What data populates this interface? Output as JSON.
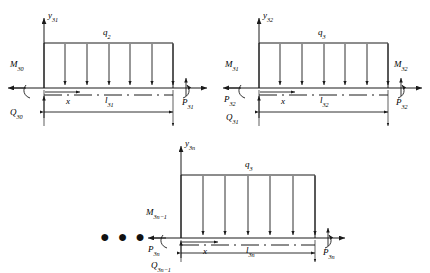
{
  "figure": {
    "type": "free-body-diagram-set",
    "ellipsis": "● ● ●",
    "stroke_color": "#1a1a1a",
    "beam_fill": "#ffffff"
  },
  "beams": [
    {
      "id": "beam-1",
      "axis_label": "y",
      "axis_sub": "31",
      "load_label": "q",
      "load_sub": "2",
      "left_moment_label": "M",
      "left_moment_sub": "30",
      "left_shear_label": "Q",
      "left_shear_sub": "30",
      "right_force_label": "P",
      "right_force_sub": "31",
      "coord_label": "x",
      "length_label": "l",
      "length_sub": "31",
      "arrow_count": 6
    },
    {
      "id": "beam-2",
      "axis_label": "y",
      "axis_sub": "32",
      "load_label": "q",
      "load_sub": "3",
      "left_moment_label": "M",
      "left_moment_sub": "31",
      "right_moment_label": "M",
      "right_moment_sub": "32",
      "left_force_label": "P",
      "left_force_sub": "32",
      "right_force_label": "P",
      "right_force_sub": "32",
      "left_shear_label": "Q",
      "left_shear_sub": "31",
      "coord_label": "x",
      "length_label": "l",
      "length_sub": "32",
      "arrow_count": 6
    },
    {
      "id": "beam-3",
      "axis_label": "y",
      "axis_sub": "3n",
      "load_label": "q",
      "load_sub": "3",
      "left_moment_label": "M",
      "left_moment_sub": "3n−1",
      "left_force_label": "P",
      "left_force_sub": "3n",
      "right_force_label": "P",
      "right_force_sub": "3n",
      "left_shear_label": "Q",
      "left_shear_sub": "3n−1",
      "coord_label": "x",
      "length_label": "l",
      "length_sub": "3n",
      "arrow_count": 6
    }
  ]
}
